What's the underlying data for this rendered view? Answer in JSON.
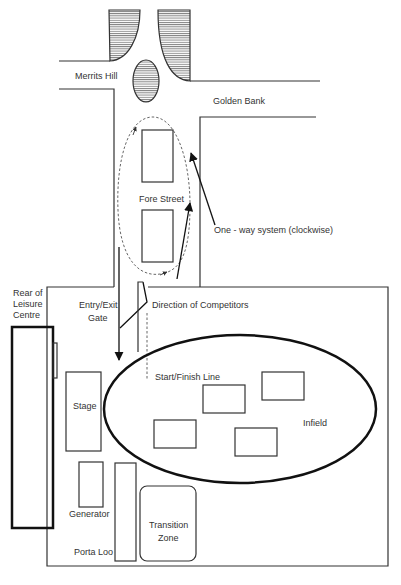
{
  "diagram": {
    "roads": {
      "merrits_hill": "Merrits Hill",
      "golden_bank": "Golden Bank",
      "fore_street": "Fore Street"
    },
    "annotations": {
      "one_way": "One - way system (clockwise)",
      "direction_competitors": "Direction of Competitors",
      "entry_exit_line1": "Entry/Exit",
      "entry_exit_line2": "Gate",
      "start_finish": "Start/Finish Line"
    },
    "buildings": {
      "leisure_line1": "Rear of",
      "leisure_line2": "Leisure",
      "leisure_line3": "Centre"
    },
    "site": {
      "stage": "Stage",
      "generator": "Generator",
      "porta_loo": "Porta Loo",
      "transition_line1": "Transition",
      "transition_line2": "Zone",
      "infield": "Infield"
    },
    "colors": {
      "line": "#333333",
      "track": "#111111",
      "hatch": "#555555",
      "background": "#ffffff"
    }
  }
}
